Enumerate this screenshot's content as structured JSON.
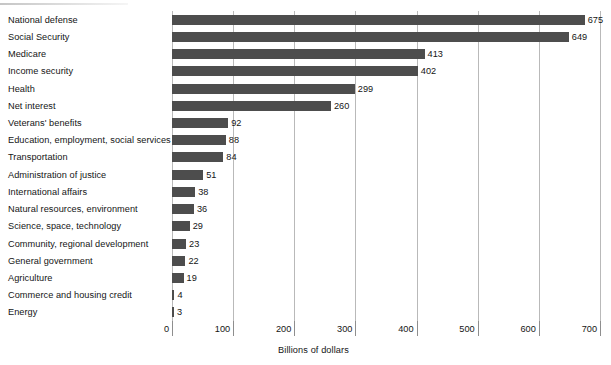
{
  "chart_data": {
    "type": "bar",
    "orientation": "horizontal",
    "title": "",
    "xlabel": "Billions of dollars",
    "ylabel": "",
    "xlim": [
      0,
      700
    ],
    "xticks": [
      0,
      100,
      200,
      300,
      400,
      500,
      600,
      700
    ],
    "grid": "vertical",
    "legend": "none",
    "bar_color": "#4d4d4d",
    "gridline_color": "#b9b9b9",
    "categories": [
      "National defense",
      "Social Security",
      "Medicare",
      "Income security",
      "Health",
      "Net interest",
      "Veterans' benefits",
      "Education, employment, social services",
      "Transportation",
      "Administration of justice",
      "International affairs",
      "Natural resources, environment",
      "Science, space, technology",
      "Community, regional development",
      "General government",
      "Agriculture",
      "Commerce and housing credit",
      "Energy"
    ],
    "values": [
      675,
      649,
      413,
      402,
      299,
      260,
      92,
      88,
      84,
      51,
      38,
      36,
      29,
      23,
      22,
      19,
      4,
      3
    ],
    "value_labels": [
      "675",
      "649",
      "413",
      "402",
      "299",
      "260",
      "92",
      "88",
      "84",
      "51",
      "38",
      "36",
      "29",
      "23",
      "22",
      "19",
      "4",
      "3"
    ],
    "xtick_labels": [
      "0",
      "100",
      "200",
      "300",
      "400",
      "500",
      "600",
      "700"
    ]
  }
}
